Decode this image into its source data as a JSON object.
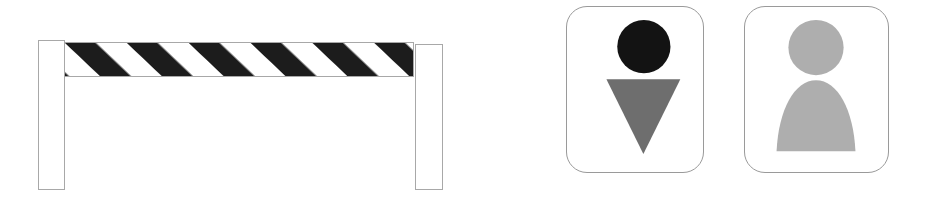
{
  "canvas": {
    "width": 925,
    "height": 206,
    "background_color": "#ffffff"
  },
  "figures": [
    {
      "name": "road-barrier",
      "label": "Striped road barrier",
      "parts": {
        "left_post_label": "left support post",
        "right_post_label": "right support post",
        "rail_label": "striped horizontal rail"
      },
      "colors": {
        "post_fill": "#ffffff",
        "post_outline": "#a8a8a8",
        "rail_fill": "#ffffff",
        "rail_outline": "#a8a8a8",
        "stripe_color": "#1c1c1c"
      },
      "stripes": {
        "count": 8,
        "angle_degrees": 45,
        "direction": "lower-left to upper-right"
      }
    },
    {
      "name": "pictogram-dark-figure",
      "label": "Dark head with inverted triangle body pictogram",
      "parts": {
        "head_label": "circular head",
        "body_label": "inverted triangle body"
      },
      "colors": {
        "card_fill": "#ffffff",
        "card_border": "#9a9a9a",
        "head_color": "#131313",
        "body_color": "#6e6e6e"
      }
    },
    {
      "name": "pictogram-light-figure",
      "label": "Light head with dome body pictogram",
      "parts": {
        "head_label": "circular head",
        "body_label": "dome shaped body"
      },
      "colors": {
        "card_fill": "#ffffff",
        "card_border": "#9a9a9a",
        "head_color": "#aeaeae",
        "body_color": "#aeaeae"
      }
    }
  ]
}
